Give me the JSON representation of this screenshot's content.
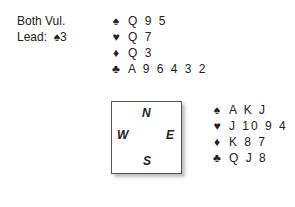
{
  "info": {
    "vulnerability": "Both Vul.",
    "lead_label": "Lead:",
    "lead_card": "♠3"
  },
  "suits": {
    "spades": "♠",
    "hearts": "♥",
    "diamonds": "♦",
    "clubs": "♣"
  },
  "north": {
    "spades": "Q 9 5",
    "hearts": "Q 7",
    "diamonds": "Q 3",
    "clubs": "A 9 6 4 3 2"
  },
  "east": {
    "spades": "A K J",
    "hearts": "J 10 9 4",
    "diamonds": "K 8 7",
    "clubs": "Q J 8"
  },
  "compass": {
    "n": "N",
    "w": "W",
    "e": "E",
    "s": "S"
  }
}
